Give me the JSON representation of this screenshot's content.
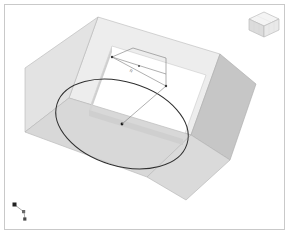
{
  "app": {
    "title": "3D CAD Viewport",
    "background_color": "#ffffff",
    "frame_color": "#c9c9c9"
  },
  "model": {
    "name": "rectangular-slab-with-circular-cut",
    "projection": "isometric",
    "faces": {
      "top_color": "#e8e8e8",
      "front_left_color": "#bdbdbd",
      "front_right_color": "#d2d2d2",
      "inner_left_color": "#d6d6d6",
      "inner_right_color": "#c4c4c4",
      "edge_color": "#a8a8a8"
    }
  },
  "sketch": {
    "circle": {
      "name": "circle-profile",
      "edge_color": "#2f2f2f",
      "center_point_color": "#1a1a1a"
    }
  },
  "annotation": {
    "name": "radius-dimension",
    "label": "R",
    "line_color": "#6a6a6a",
    "vertex_color": "#3a3a3a"
  },
  "viewcube": {
    "name": "view-cube",
    "top_color": "#f2f2f2",
    "left_color": "#d8d8d8",
    "right_color": "#e6e6e6",
    "edge_color": "#b4b4b4"
  },
  "axis_triad": {
    "name": "coordinate-axis-triad",
    "origin_color": "#222222",
    "x_color": "#555555",
    "y_color": "#777777",
    "z_color": "#444444",
    "line_color": "#8a8a8a"
  }
}
